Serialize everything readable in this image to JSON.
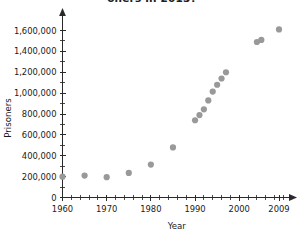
{
  "chart_data": {
    "type": "scatter",
    "title": "oners in 2013?",
    "title_note": "clipped at top edge of screenshot",
    "xlabel": "Year",
    "ylabel": "Prisoners",
    "xlim": [
      1960,
      2011
    ],
    "ylim": [
      0,
      1700000
    ],
    "grid": false,
    "legend": null,
    "point_color": "#999999",
    "axis_color": "#2a2a2a",
    "x_tick_labels": [
      "1960",
      "1970",
      "1980",
      "1990",
      "2000",
      "2009"
    ],
    "x_tick_values": [
      1960,
      1970,
      1980,
      1990,
      2000,
      2009
    ],
    "x_minor_step": 2,
    "y_tick_labels": [
      "0",
      "200,000",
      "400,000",
      "600,000",
      "800,000",
      "1,000,000",
      "1,200,000",
      "1,400,000",
      "1,600,000"
    ],
    "y_tick_values": [
      0,
      200000,
      400000,
      600000,
      800000,
      1000000,
      1200000,
      1400000,
      1600000
    ],
    "y_minor_step": 100000,
    "x": [
      1960,
      1965,
      1970,
      1975,
      1980,
      1985,
      1990,
      1991,
      1992,
      1993,
      1994,
      1995,
      1996,
      1997,
      2004,
      2005,
      2009
    ],
    "y": [
      200000,
      210000,
      195000,
      235000,
      315000,
      480000,
      740000,
      790000,
      845000,
      930000,
      1015000,
      1080000,
      1140000,
      1200000,
      1490000,
      1510000,
      1610000
    ],
    "points": [
      {
        "x": 1960,
        "y": 200000
      },
      {
        "x": 1965,
        "y": 210000
      },
      {
        "x": 1970,
        "y": 195000
      },
      {
        "x": 1975,
        "y": 235000
      },
      {
        "x": 1980,
        "y": 315000
      },
      {
        "x": 1985,
        "y": 480000
      },
      {
        "x": 1990,
        "y": 740000
      },
      {
        "x": 1991,
        "y": 790000
      },
      {
        "x": 1992,
        "y": 845000
      },
      {
        "x": 1993,
        "y": 930000
      },
      {
        "x": 1994,
        "y": 1015000
      },
      {
        "x": 1995,
        "y": 1080000
      },
      {
        "x": 1996,
        "y": 1140000
      },
      {
        "x": 1997,
        "y": 1200000
      },
      {
        "x": 2004,
        "y": 1490000
      },
      {
        "x": 2005,
        "y": 1510000
      },
      {
        "x": 2009,
        "y": 1610000
      }
    ]
  }
}
